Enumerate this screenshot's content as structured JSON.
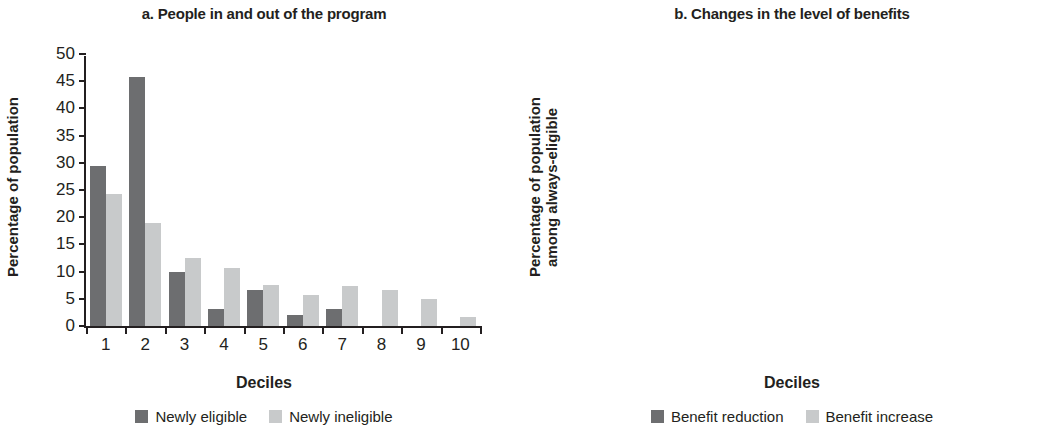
{
  "figure": {
    "xaxis_title": "Deciles"
  },
  "panels": [
    {
      "title": "a. People in and out of the program",
      "ylabel": "Percentage of population",
      "xlabel": "Deciles",
      "legend": [
        {
          "label": "Newly eligible",
          "color": "#6d6e70"
        },
        {
          "label": "Newly ineligible",
          "color": "#c8cacb"
        }
      ]
    },
    {
      "title": "b. Changes in the level of benefits",
      "ylabel": "Percentage of population\namong always-eligible",
      "xlabel": "Deciles",
      "legend": [
        {
          "label": "Benefit reduction",
          "color": "#6d6e70"
        },
        {
          "label": "Benefit increase",
          "color": "#c8cacb"
        }
      ]
    }
  ],
  "chart_data": [
    {
      "type": "bar",
      "title": "a. People in and out of the program",
      "xlabel": "Deciles",
      "ylabel": "Percentage of population",
      "categories": [
        "1",
        "2",
        "3",
        "4",
        "5",
        "6",
        "7",
        "8",
        "9",
        "10"
      ],
      "series": [
        {
          "name": "Newly eligible",
          "color": "#6d6e70",
          "values": [
            29.4,
            45.7,
            10.0,
            3.2,
            6.6,
            2.0,
            3.1,
            0,
            0,
            0
          ]
        },
        {
          "name": "Newly ineligible",
          "color": "#c8cacb",
          "values": [
            24.2,
            19.0,
            12.5,
            10.6,
            7.5,
            5.7,
            7.3,
            6.6,
            4.9,
            1.6
          ]
        }
      ],
      "ylim": [
        0,
        50
      ],
      "yticks": [
        0,
        5,
        10,
        15,
        20,
        25,
        30,
        35,
        40,
        45,
        50
      ],
      "grid": false,
      "legend_position": "bottom"
    },
    {
      "type": "bar",
      "title": "b. Changes in the level of benefits",
      "xlabel": "Deciles",
      "ylabel": "Percentage of population among always-eligible",
      "categories": [
        "1",
        "2",
        "3",
        "4",
        "5",
        "6",
        "7",
        "8",
        "9",
        "10"
      ],
      "series": [
        {
          "name": "Benefit reduction",
          "color": "#6d6e70",
          "values": [
            55.0,
            19.8,
            9.0,
            4.0,
            3.9,
            3.8,
            2.0,
            0.4,
            1.5,
            0
          ]
        },
        {
          "name": "Benefit increase",
          "color": "#c8cacb",
          "values": [
            73.0,
            14.2,
            5.0,
            1.6,
            3.4,
            0,
            0,
            2.1,
            0,
            0.8
          ]
        }
      ],
      "ylim": [
        0,
        80
      ],
      "yticks": [
        0,
        10,
        20,
        30,
        40,
        50,
        60,
        70,
        80
      ],
      "grid": false,
      "legend_position": "bottom"
    }
  ]
}
